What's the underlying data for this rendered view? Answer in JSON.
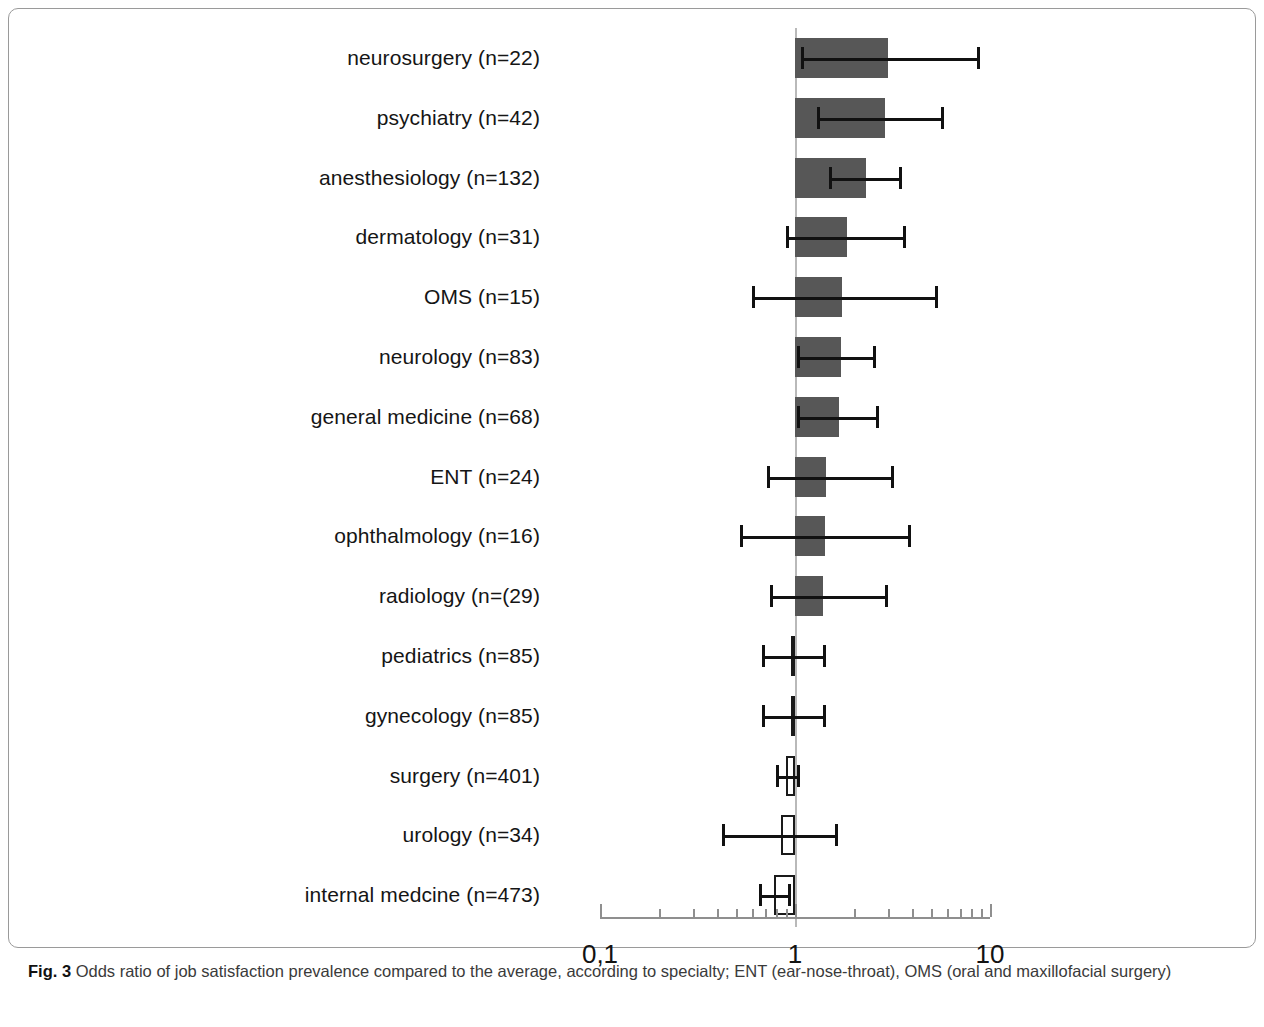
{
  "figure": {
    "number_label": "Fig. 3",
    "caption": " Odds ratio of job satisfaction prevalence compared to the average, according to specialty; ENT (ear-nose-throat), OMS (oral and maxillofacial surgery)"
  },
  "chart_data": {
    "type": "bar",
    "orientation": "horizontal",
    "title": "",
    "xlabel": "",
    "ylabel": "",
    "scale": "log",
    "xlim": [
      0.1,
      10
    ],
    "grid": false,
    "legend": null,
    "reference_line": 1,
    "tick_labels": [
      "0,1",
      "1",
      "10"
    ],
    "tick_values": [
      0.1,
      1,
      10
    ],
    "value_name": "odds ratio",
    "error_name": "95% confidence interval",
    "categories": [
      "neurosurgery (n=22)",
      "psychiatry (n=42)",
      "anesthesiology (n=132)",
      "dermatology (n=31)",
      "OMS (n=15)",
      "neurology (n=83)",
      "general medicine (n=68)",
      "ENT (n=24)",
      "ophthalmology (n=16)",
      "radiology (n=(29)",
      "pediatrics (n=85)",
      "gynecology (n=85)",
      "surgery (n=401)",
      "urology (n=34)",
      "internal medcine (n=473)"
    ],
    "values": [
      3.0,
      2.9,
      2.3,
      1.85,
      1.75,
      1.72,
      1.68,
      1.45,
      1.42,
      1.4,
      0.95,
      0.95,
      0.9,
      0.85,
      0.78
    ],
    "ci_low": [
      1.07,
      1.3,
      1.5,
      0.9,
      0.6,
      1.02,
      1.02,
      0.72,
      0.52,
      0.74,
      0.68,
      0.68,
      0.8,
      0.42,
      0.65
    ],
    "ci_high": [
      8.6,
      5.6,
      3.4,
      3.6,
      5.2,
      2.5,
      2.6,
      3.1,
      3.8,
      2.9,
      1.4,
      1.4,
      1.02,
      1.6,
      0.92
    ],
    "bar_style": [
      "filled",
      "filled",
      "filled",
      "filled",
      "filled",
      "filled",
      "filled",
      "filled",
      "filled",
      "filled",
      "hollow",
      "hollow",
      "hollow",
      "hollow",
      "hollow"
    ],
    "colors": {
      "bar_fill": "#575757",
      "bar_outline": "#1a1a1a",
      "error_bar": "#111111",
      "axis": "#8f8f8f",
      "reference_line": "#b9b9b9"
    }
  }
}
